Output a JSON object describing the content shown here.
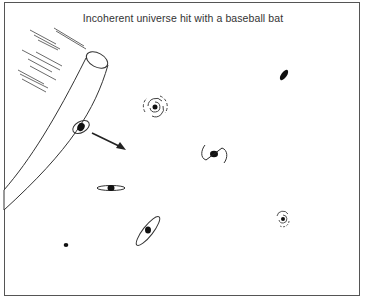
{
  "figure": {
    "title": "Incoherent universe hit with a baseball bat",
    "elements": [
      {
        "name": "baseball-bat",
        "description": "large bat entering from left with speed lines"
      },
      {
        "name": "motion-arrow",
        "description": "arrow pointing down-right from hit galaxy"
      },
      {
        "name": "galaxy-hit",
        "description": "small tilted galaxy near bat"
      },
      {
        "name": "galaxy-spiral-1",
        "description": "spiral galaxy"
      },
      {
        "name": "galaxy-ellipse-1",
        "description": "small elliptical blob top right"
      },
      {
        "name": "galaxy-barred",
        "description": "barred spiral galaxy center"
      },
      {
        "name": "galaxy-edge-on",
        "description": "edge-on disk galaxy"
      },
      {
        "name": "galaxy-spiral-2",
        "description": "small spiral galaxy right"
      },
      {
        "name": "galaxy-tilted-disk",
        "description": "inclined disk galaxy bottom center"
      },
      {
        "name": "galaxy-dot",
        "description": "small dot bottom left"
      }
    ]
  },
  "colors": {
    "ink": "#222222",
    "frame": "#555555",
    "background": "#ffffff"
  }
}
